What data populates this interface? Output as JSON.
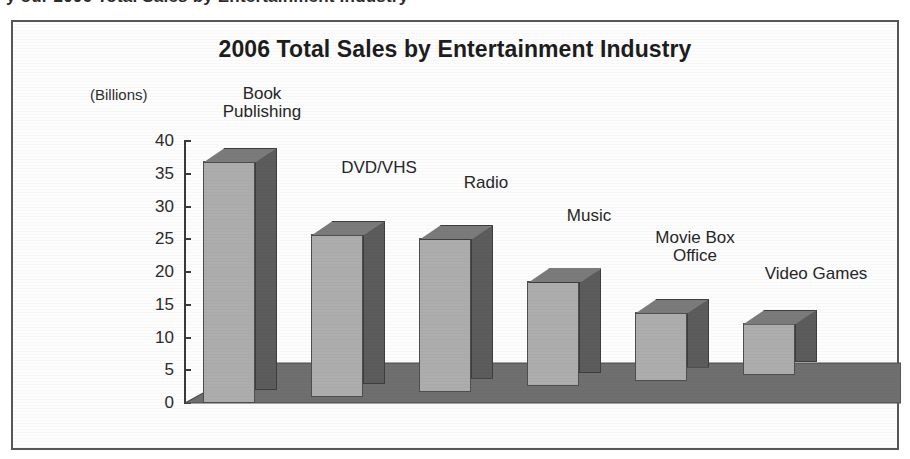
{
  "scan": {
    "clipped_header_text": "y our 2006 Total Sales by Entertainment Industry"
  },
  "chart": {
    "title": "2006 Total Sales by Entertainment Industry",
    "unit_label": "(Billions)"
  },
  "chart_data": {
    "type": "bar",
    "title": "2006 Total Sales by Entertainment Industry",
    "xlabel": "",
    "ylabel": "(Billions)",
    "ylim": [
      0,
      40
    ],
    "ytick_labels": [
      "0",
      "5",
      "10",
      "15",
      "20",
      "25",
      "30",
      "35",
      "40"
    ],
    "yticks": [
      0,
      5,
      10,
      15,
      20,
      25,
      30,
      35,
      40
    ],
    "grid": false,
    "legend": "none",
    "style": "3d-column",
    "categories": [
      "Book Publishing",
      "DVD/VHS",
      "Radio",
      "Music",
      "Movie Box Office",
      "Video Games"
    ],
    "values": [
      37,
      25,
      23.5,
      16,
      10.5,
      8
    ],
    "colors": {
      "bar_front": "#adadad",
      "bar_side": "#5c5c5c",
      "bar_top": "#7b7b7b",
      "floor": "#6f6f6f",
      "axis": "#3a3a3a",
      "text": "#262626",
      "frame": "#55565a",
      "background": "#fdfdfd"
    }
  },
  "bars": [
    {
      "label": "Book\nPublishing",
      "value": 37
    },
    {
      "label": "DVD/VHS",
      "value": 25
    },
    {
      "label": "Radio",
      "value": 23.5
    },
    {
      "label": "Music",
      "value": 16
    },
    {
      "label": "Movie Box\nOffice",
      "value": 10.5
    },
    {
      "label": "Video Games",
      "value": 8
    }
  ],
  "ticks": [
    {
      "label": "40"
    },
    {
      "label": "35"
    },
    {
      "label": "30"
    },
    {
      "label": "25"
    },
    {
      "label": "20"
    },
    {
      "label": "15"
    },
    {
      "label": "10"
    },
    {
      "label": "5"
    },
    {
      "label": "0"
    }
  ]
}
